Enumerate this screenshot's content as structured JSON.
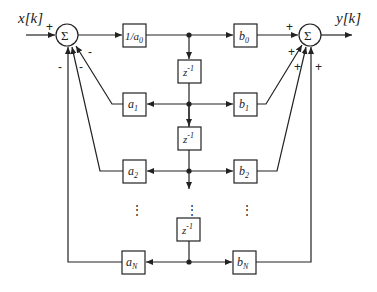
{
  "diagram": {
    "type": "IIR filter block diagram (Direct Form II)",
    "input_label": "x[k]",
    "output_label": "y[k]",
    "summers": {
      "left": {
        "symbol": "Σ",
        "input_sign": "+",
        "feedback_signs": [
          "-",
          "-",
          "-"
        ]
      },
      "right": {
        "symbol": "Σ",
        "signs": [
          "+",
          "+",
          "+",
          "+"
        ]
      }
    },
    "gain_input": "1/a0",
    "delays": [
      "z-1",
      "z-1",
      "z-1"
    ],
    "feedback_coeffs": [
      "a1",
      "a2",
      "aN"
    ],
    "feedforward_coeffs": [
      "b0",
      "b1",
      "b2",
      "bN"
    ],
    "ellipsis": "⋮",
    "labels": {
      "x_k": "x[k]",
      "y_k": "y[k]",
      "sigma": "Σ",
      "inv_a0_num": "1/a",
      "inv_a0_sub": "0",
      "z": "z",
      "z_exp": "-1",
      "a": "a",
      "b": "b",
      "sub_0": "0",
      "sub_1": "1",
      "sub_2": "2",
      "sub_N": "N",
      "plus": "+",
      "minus": "-",
      "dots": "⋮"
    }
  }
}
